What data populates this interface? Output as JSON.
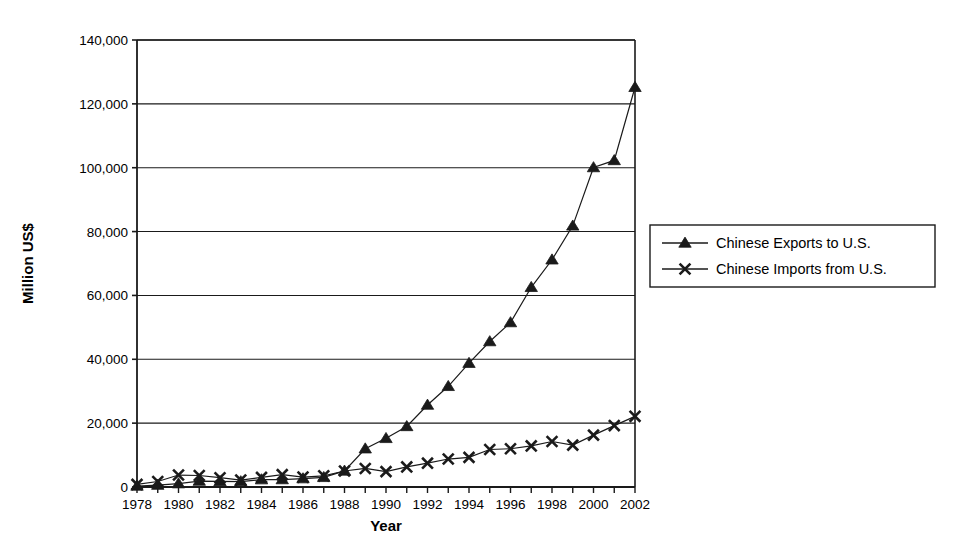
{
  "chart_data": {
    "type": "line",
    "title": "",
    "xlabel": "Year",
    "ylabel": "Million US$",
    "xlim": [
      1978,
      2002
    ],
    "ylim": [
      0,
      140000
    ],
    "grid": "horizontal",
    "legend_position": "right",
    "x": [
      1978,
      1979,
      1980,
      1981,
      1982,
      1983,
      1984,
      1985,
      1986,
      1987,
      1988,
      1989,
      1990,
      1991,
      1992,
      1993,
      1994,
      1995,
      1996,
      1997,
      1998,
      1999,
      2000,
      2001,
      2002
    ],
    "xtick_labels": [
      "1978",
      "1980",
      "1982",
      "1984",
      "1986",
      "1988",
      "1990",
      "1992",
      "1994",
      "1996",
      "1998",
      "2000",
      "2002"
    ],
    "xticks": [
      1978,
      1980,
      1982,
      1984,
      1986,
      1988,
      1990,
      1992,
      1994,
      1996,
      1998,
      2000,
      2002
    ],
    "yticks": [
      0,
      20000,
      40000,
      60000,
      80000,
      100000,
      120000,
      140000
    ],
    "ytick_labels": [
      "0",
      "20,000",
      "40,000",
      "60,000",
      "80,000",
      "100,000",
      "120,000",
      "140,000"
    ],
    "series": [
      {
        "name": "Chinese Exports to U.S.",
        "marker": "triangle",
        "color": "#1a1a1a",
        "values": [
          320,
          600,
          1060,
          1870,
          1740,
          1710,
          2310,
          2340,
          2630,
          3030,
          5040,
          11990,
          15240,
          18970,
          25680,
          31540,
          38780,
          45560,
          51510,
          62550,
          71170,
          81790,
          100060,
          102280,
          125200
        ]
      },
      {
        "name": "Chinese Imports from U.S.",
        "marker": "x",
        "color": "#1a1a1a",
        "values": [
          820,
          1720,
          3750,
          3600,
          2910,
          2170,
          3000,
          3860,
          3110,
          3500,
          5020,
          5810,
          4810,
          6290,
          7470,
          8760,
          9280,
          11750,
          11990,
          12860,
          14240,
          13110,
          16250,
          19230,
          22130
        ]
      }
    ]
  },
  "legend": {
    "items": [
      {
        "label": "Chinese Exports to U.S.",
        "marker": "triangle"
      },
      {
        "label": "Chinese Imports from U.S.",
        "marker": "x"
      }
    ]
  },
  "axes": {
    "y_axis_title": "Million US$",
    "x_axis_title": "Year"
  }
}
